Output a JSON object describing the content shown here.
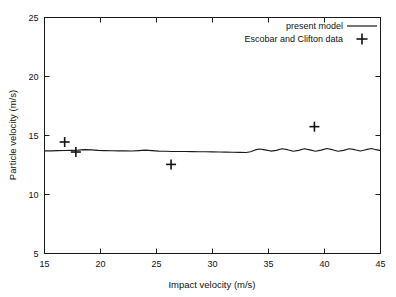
{
  "chart_data": {
    "type": "line",
    "title": "",
    "xlabel": "Impact velocity (m/s)",
    "ylabel": "Particle velocity (m/s)",
    "xlim": [
      15,
      45
    ],
    "ylim": [
      5,
      25
    ],
    "xticks": [
      15,
      20,
      25,
      30,
      35,
      40,
      45
    ],
    "xtick_labels": [
      "15",
      "20",
      "25",
      "30",
      "35",
      "40",
      "45"
    ],
    "yticks": [
      5,
      10,
      15,
      20,
      25
    ],
    "ytick_labels": [
      "5",
      "10",
      "15",
      "20",
      "25"
    ],
    "grid": false,
    "legend_position": "top-right",
    "series": [
      {
        "name": "present model",
        "type": "line",
        "marker": "none",
        "color": "#1a1a1a",
        "x": [
          15.0,
          15.6,
          16.2,
          16.8,
          17.4,
          18.0,
          18.6,
          19.2,
          19.8,
          20.4,
          21.0,
          21.6,
          22.2,
          22.8,
          23.4,
          24.0,
          24.6,
          25.2,
          25.8,
          26.4,
          27.0,
          27.6,
          28.2,
          28.8,
          29.4,
          30.0,
          30.6,
          31.2,
          31.8,
          32.4,
          33.0,
          33.4,
          33.8,
          34.2,
          34.7,
          35.2,
          35.7,
          36.2,
          36.7,
          37.2,
          37.7,
          38.2,
          38.7,
          39.2,
          39.7,
          40.2,
          40.7,
          41.2,
          41.7,
          42.2,
          42.7,
          43.2,
          43.7,
          44.2,
          44.6,
          45.0
        ],
        "y": [
          13.7,
          13.7,
          13.72,
          13.73,
          13.74,
          13.76,
          13.8,
          13.78,
          13.74,
          13.72,
          13.71,
          13.7,
          13.7,
          13.69,
          13.72,
          13.76,
          13.72,
          13.68,
          13.66,
          13.65,
          13.64,
          13.64,
          13.63,
          13.62,
          13.62,
          13.61,
          13.6,
          13.59,
          13.58,
          13.57,
          13.56,
          13.62,
          13.78,
          13.86,
          13.78,
          13.68,
          13.74,
          13.88,
          13.8,
          13.66,
          13.74,
          13.88,
          13.78,
          13.66,
          13.76,
          13.9,
          13.8,
          13.66,
          13.74,
          13.88,
          13.8,
          13.68,
          13.8,
          13.9,
          13.8,
          13.72
        ]
      },
      {
        "name": "Escobar and Clifton data",
        "type": "scatter",
        "marker": "plus",
        "color": "#111111",
        "points": [
          {
            "x": 16.8,
            "y": 14.45
          },
          {
            "x": 17.8,
            "y": 13.6
          },
          {
            "x": 26.3,
            "y": 12.55
          },
          {
            "x": 39.1,
            "y": 15.75
          }
        ]
      }
    ]
  },
  "legend": {
    "items": [
      {
        "label": "present model",
        "symbol": "line"
      },
      {
        "label": "Escobar and Clifton data",
        "symbol": "plus"
      }
    ]
  }
}
